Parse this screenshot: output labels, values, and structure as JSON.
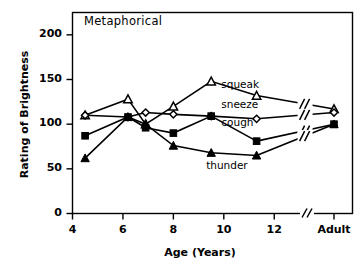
{
  "chart_data": {
    "type": "line",
    "title": "Metaphorical",
    "xlabel": "Age (Years)",
    "ylabel": "Rating of Brightness",
    "xlim": [
      4,
      14.6
    ],
    "ylim": [
      0,
      225
    ],
    "yticks": [
      0,
      50,
      100,
      150,
      200
    ],
    "xticks": [
      "4",
      "6",
      "8",
      "10",
      "12"
    ],
    "xtick_values": [
      4,
      6,
      8,
      10,
      12
    ],
    "adult_tick_label": "Adult",
    "axis_break": true,
    "grid": false,
    "legend": "inline-labels",
    "x": [
      4.5,
      6.2,
      6.9,
      8.0,
      9.5,
      11.3,
      "Adult"
    ],
    "series": [
      {
        "name": "squeak",
        "marker": "open-triangle",
        "values": [
          110,
          128,
          100,
          120,
          148,
          132,
          117
        ]
      },
      {
        "name": "sneeze",
        "marker": "open-diamond",
        "values": [
          110,
          108,
          113,
          111,
          109,
          106,
          113
        ]
      },
      {
        "name": "cough",
        "marker": "filled-square",
        "values": [
          87,
          108,
          96,
          90,
          109,
          81,
          100
        ]
      },
      {
        "name": "thunder",
        "marker": "filled-triangle",
        "values": [
          62,
          108,
          100,
          76,
          68,
          65,
          100
        ]
      }
    ],
    "annotations": [
      {
        "text": "squeak",
        "x": 9.9,
        "y": 143
      },
      {
        "text": "sneeze",
        "x": 9.9,
        "y": 120
      },
      {
        "text": "cough",
        "x": 9.9,
        "y": 100
      },
      {
        "text": "thunder",
        "x": 9.3,
        "y": 52
      }
    ]
  }
}
